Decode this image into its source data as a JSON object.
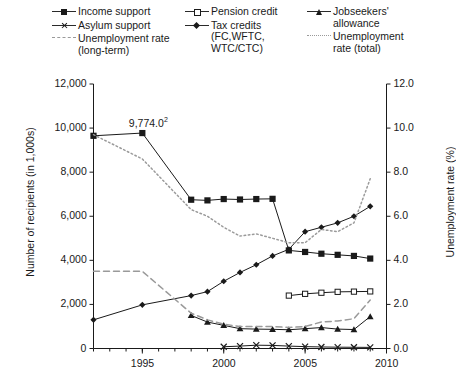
{
  "legend": {
    "columns": [
      {
        "items": [
          {
            "label": "Income support",
            "marker": "filled-square",
            "line": "solid"
          },
          {
            "label": "Asylum support",
            "marker": "cross",
            "line": "solid"
          },
          {
            "label": "Unemployment rate\n(long-term)",
            "marker": "none",
            "line": "dashed"
          }
        ]
      },
      {
        "items": [
          {
            "label": "Pension credit",
            "marker": "open-square",
            "line": "solid"
          },
          {
            "label": "Tax credits\n(FC,WFTC,\nWTC/CTC)",
            "marker": "diamond",
            "line": "solid"
          }
        ]
      },
      {
        "items": [
          {
            "label": "Jobseekers'\nallowance",
            "marker": "triangle",
            "line": "solid"
          },
          {
            "label": "Unemployment\nrate (total)",
            "marker": "none",
            "line": "dotted"
          }
        ]
      }
    ]
  },
  "chart_data": {
    "type": "line",
    "title": "",
    "xlabel": "",
    "ylabel": "Number of recipients (in 1,000s)",
    "y2label": "Unemployment rate (%)",
    "xlim": [
      1992,
      2010
    ],
    "ylim": [
      0,
      12000
    ],
    "y2lim": [
      0,
      12.0
    ],
    "grid": false,
    "legend_position": "top",
    "xticks_major": [
      1995,
      2000,
      2005,
      2010
    ],
    "xticks_minor": [
      1992,
      1993,
      1994,
      1995,
      1996,
      1997,
      1998,
      1999,
      2000,
      2001,
      2002,
      2003,
      2004,
      2005,
      2006,
      2007,
      2008,
      2009,
      2010
    ],
    "yticks": [
      0,
      2000,
      4000,
      6000,
      8000,
      10000,
      12000
    ],
    "ytick_labels": [
      "0",
      "2,000",
      "4,000",
      "6,000",
      "8,000",
      "10,000",
      "12,000"
    ],
    "y2ticks": [
      0.0,
      2.0,
      4.0,
      6.0,
      8.0,
      10.0,
      12.0
    ],
    "y2tick_labels": [
      "0.0",
      "2.0",
      "4.0",
      "6.0",
      "8.0",
      "10.0",
      "12.0"
    ],
    "annotations": [
      {
        "text": "9,774.0",
        "superscript": "2",
        "x": 1995,
        "y": 9774,
        "series": "Income support"
      }
    ],
    "series": [
      {
        "name": "Income support",
        "axis": "left",
        "marker": "filled-square",
        "line": "solid",
        "color": "#1a1a1a",
        "x": [
          1992,
          1995,
          1998,
          1999,
          2000,
          2001,
          2002,
          2003,
          2004,
          2005,
          2006,
          2007,
          2008,
          2009
        ],
        "values": [
          9650,
          9774,
          6750,
          6720,
          6780,
          6760,
          6780,
          6790,
          4450,
          4380,
          4300,
          4250,
          4200,
          4080
        ]
      },
      {
        "name": "Asylum support",
        "axis": "left",
        "marker": "cross",
        "line": "solid",
        "color": "#1a1a1a",
        "x": [
          2000,
          2001,
          2002,
          2003,
          2004,
          2005,
          2006,
          2007,
          2008,
          2009
        ],
        "values": [
          80,
          110,
          150,
          140,
          110,
          85,
          70,
          60,
          55,
          50
        ]
      },
      {
        "name": "Pension credit",
        "axis": "left",
        "marker": "open-square",
        "line": "solid",
        "color": "#1a1a1a",
        "x": [
          2004,
          2005,
          2006,
          2007,
          2008,
          2009
        ],
        "values": [
          2400,
          2480,
          2530,
          2570,
          2580,
          2590
        ]
      },
      {
        "name": "Tax credits (FC,WFTC,WTC/CTC)",
        "axis": "left",
        "marker": "diamond",
        "line": "solid",
        "color": "#1a1a1a",
        "x": [
          1992,
          1995,
          1998,
          1999,
          2000,
          2001,
          2002,
          2003,
          2004,
          2005,
          2006,
          2007,
          2008,
          2009
        ],
        "values": [
          1300,
          1980,
          2400,
          2580,
          3050,
          3450,
          3800,
          4200,
          4500,
          5300,
          5500,
          5700,
          6000,
          6450
        ]
      },
      {
        "name": "Jobseekers' allowance",
        "axis": "left",
        "marker": "triangle",
        "line": "solid",
        "color": "#1a1a1a",
        "x": [
          1998,
          1999,
          2000,
          2001,
          2002,
          2003,
          2004,
          2005,
          2006,
          2007,
          2008,
          2009
        ],
        "values": [
          1500,
          1200,
          1050,
          900,
          880,
          870,
          850,
          900,
          950,
          880,
          860,
          1450
        ]
      },
      {
        "name": "Unemployment rate (long-term)",
        "axis": "right",
        "marker": "none",
        "line": "dashed",
        "color": "#9a9a9a",
        "x": [
          1992,
          1995,
          1998,
          1999,
          2000,
          2001,
          2002,
          2003,
          2004,
          2005,
          2006,
          2007,
          2008,
          2009
        ],
        "values": [
          3.5,
          3.5,
          1.6,
          1.3,
          1.1,
          1.0,
          1.0,
          1.0,
          0.95,
          1.0,
          1.2,
          1.25,
          1.35,
          2.2
        ]
      },
      {
        "name": "Unemployment rate (total)",
        "axis": "right",
        "marker": "none",
        "line": "dotted",
        "color": "#9a9a9a",
        "x": [
          1992,
          1995,
          1998,
          1999,
          2000,
          2001,
          2002,
          2003,
          2004,
          2005,
          2006,
          2007,
          2008,
          2009
        ],
        "values": [
          9.7,
          8.6,
          6.3,
          6.0,
          5.5,
          5.1,
          5.2,
          5.0,
          4.8,
          4.8,
          5.4,
          5.3,
          5.7,
          7.7
        ]
      }
    ]
  }
}
